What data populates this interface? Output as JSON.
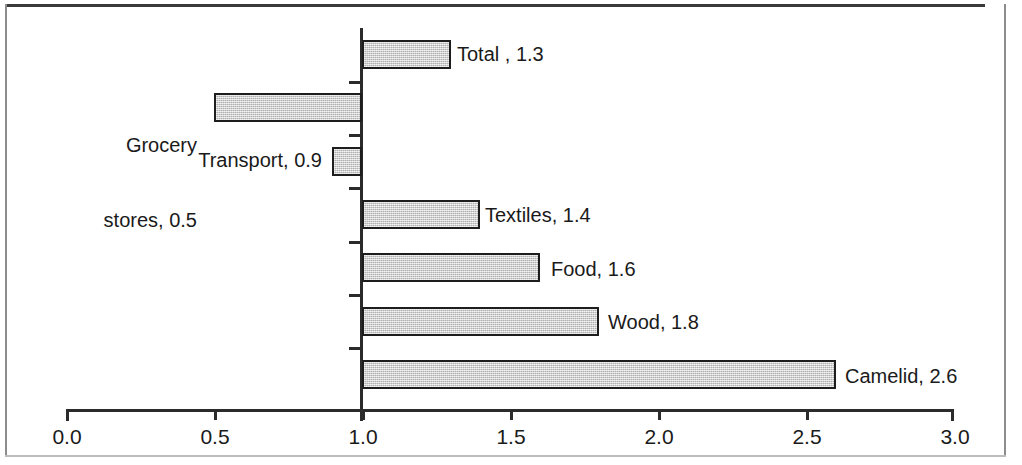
{
  "chart_data": {
    "type": "bar",
    "orientation": "horizontal",
    "title": "",
    "xlabel": "",
    "ylabel": "",
    "xlim": [
      0.0,
      3.0
    ],
    "baseline": 1.0,
    "grid": false,
    "legend": null,
    "xticks": [
      "0.0",
      "0.5",
      "1.0",
      "1.5",
      "2.0",
      "2.5",
      "3.0"
    ],
    "xtick_values": [
      0.0,
      0.5,
      1.0,
      1.5,
      2.0,
      2.5,
      3.0
    ],
    "categories": [
      "Total",
      "Grocery stores",
      "Transport",
      "Textiles",
      "Food",
      "Wood",
      "Camelid"
    ],
    "values": [
      1.3,
      0.5,
      0.9,
      1.4,
      1.6,
      1.8,
      2.6
    ],
    "bars": [
      {
        "category": "Total",
        "value": 1.3,
        "label": "Total , 1.3",
        "side": "right"
      },
      {
        "category": "Grocery stores",
        "value": 0.5,
        "label": "Grocery\nstores, 0.5",
        "side": "left"
      },
      {
        "category": "Transport",
        "value": 0.9,
        "label": "Transport, 0.9",
        "side": "left"
      },
      {
        "category": "Textiles",
        "value": 1.4,
        "label": "Textiles, 1.4",
        "side": "right"
      },
      {
        "category": "Food",
        "value": 1.6,
        "label": "Food, 1.6",
        "side": "right"
      },
      {
        "category": "Wood",
        "value": 1.8,
        "label": "Wood, 1.8",
        "side": "right"
      },
      {
        "category": "Camelid",
        "value": 2.6,
        "label": "Camelid, 2.6",
        "side": "right"
      }
    ],
    "colors": {
      "bar_fill": "#cdcdcd",
      "bar_border": "#1d1d1d",
      "axis": "#2b2b2b",
      "text": "#1a1a1a",
      "background": "#ffffff"
    }
  },
  "labels": {
    "bar_0": "Total , 1.3",
    "bar_1_line1": "Grocery",
    "bar_1_line2": "stores, 0.5",
    "bar_2": "Transport, 0.9",
    "bar_3": "Textiles, 1.4",
    "bar_4": "Food, 1.6",
    "bar_5": "Wood, 1.8",
    "bar_6": "Camelid, 2.6"
  },
  "xticks": {
    "t0": "0.0",
    "t1": "0.5",
    "t2": "1.0",
    "t3": "1.5",
    "t4": "2.0",
    "t5": "2.5",
    "t6": "3.0"
  }
}
